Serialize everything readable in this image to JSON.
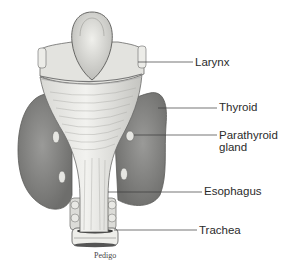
{
  "diagram": {
    "labels": [
      {
        "id": "larynx",
        "text": "Larynx"
      },
      {
        "id": "thyroid",
        "text": "Thyroid"
      },
      {
        "id": "parathyroid",
        "text": "Parathyroid",
        "text2": "gland"
      },
      {
        "id": "esophagus",
        "text": "Esophagus"
      },
      {
        "id": "trachea",
        "text": "Trachea"
      }
    ],
    "credit": "Pedigo",
    "colors": {
      "background": "#ffffff",
      "tissue_light": "#e8e8e4",
      "tissue_mid": "#c9c9c5",
      "thyroid": "#8f8f8d",
      "thyroid_dark": "#6f6f6d",
      "leader_line": "#3a3a3a",
      "text": "#2b2b2b"
    }
  }
}
